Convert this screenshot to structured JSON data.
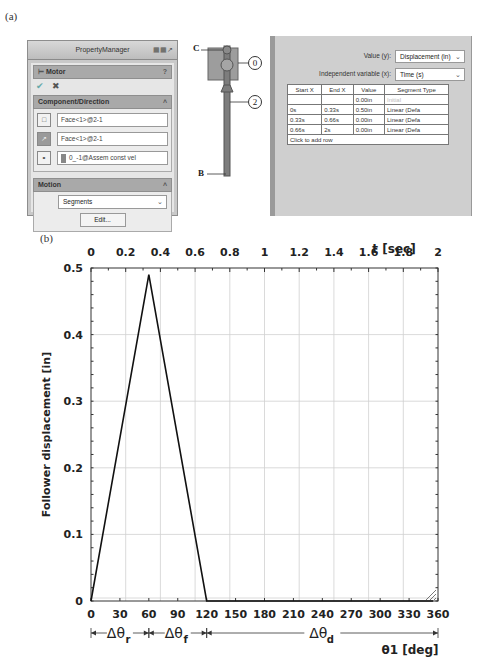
{
  "figure_labels": {
    "a": "(a)",
    "b": "(b)"
  },
  "property_manager": {
    "title": "PropertyManager",
    "title_icons": "▦▦↗",
    "feature_name": "Motor",
    "help_icon": "?",
    "ok_icon": "✔",
    "cancel_icon": "✖",
    "component_direction": {
      "header": "Component/Direction",
      "collapse_icon": "˄",
      "fields": [
        {
          "icon": "face-icon",
          "value": "Face<1>@2-1"
        },
        {
          "icon": "direction-icon",
          "value": "Face<1>@2-1"
        },
        {
          "icon": "reference-icon",
          "value": "0_-1@Assem const vel"
        }
      ]
    },
    "motion": {
      "header": "Motion",
      "collapse_icon": "˄",
      "type_value": "Segments",
      "edit_label": "Edit..."
    }
  },
  "mechanism": {
    "point_labels": [
      "C",
      "B"
    ],
    "part_labels": [
      "0",
      "2"
    ]
  },
  "segments_panel": {
    "value_label": "Value (y):",
    "value_selected": "Displacement (in)",
    "independent_label": "Independent variable (x):",
    "independent_selected": "Time (s)",
    "columns": [
      "Start X",
      "End X",
      "Value",
      "Segment Type"
    ],
    "rows": [
      [
        "",
        "",
        "0.00in",
        "Initial"
      ],
      [
        "0s",
        "0.33s",
        "0.50in",
        "Linear (Defa"
      ],
      [
        "0.33s",
        "0.66s",
        "0.00in",
        "Linear (Defa"
      ],
      [
        "0.66s",
        "2s",
        "0.00in",
        "Linear (Defa"
      ]
    ],
    "add_row_label": "Click to add row"
  },
  "chart_data": {
    "type": "line",
    "title": "",
    "xlabel": "θ1 [deg]",
    "x2label": "t [sec]",
    "ylabel": "Follower displacement [in]",
    "xlim": [
      0,
      360
    ],
    "x2lim": [
      0,
      2
    ],
    "ylim": [
      0,
      0.5
    ],
    "xticks": [
      0,
      30,
      60,
      90,
      120,
      150,
      180,
      210,
      240,
      270,
      300,
      330,
      360
    ],
    "x2ticks": [
      0,
      0.2,
      0.4,
      0.6,
      0.8,
      1,
      1.2,
      1.4,
      1.6,
      1.8,
      2
    ],
    "x2ticklabels": [
      "0",
      "0.2",
      "0.4",
      "0.6",
      "0.8",
      "1",
      "1.2",
      "1.4",
      "1.6",
      "1.8",
      "2"
    ],
    "yticks": [
      0,
      0.1,
      0.2,
      0.3,
      0.4,
      0.5
    ],
    "yticklabels": [
      "0",
      "0.1",
      "0.2",
      "0.3",
      "0.4",
      "0.5"
    ],
    "grid": true,
    "series": [
      {
        "name": "Follower displacement",
        "x": [
          0,
          60,
          120,
          355
        ],
        "y": [
          0,
          0.49,
          0,
          0
        ]
      }
    ],
    "annotations": [
      {
        "label": "Δθ",
        "sub": "r",
        "from": 0,
        "to": 60
      },
      {
        "label": "Δθ",
        "sub": "f",
        "from": 60,
        "to": 120
      },
      {
        "label": "Δθ",
        "sub": "d",
        "from": 120,
        "to": 360
      }
    ]
  }
}
